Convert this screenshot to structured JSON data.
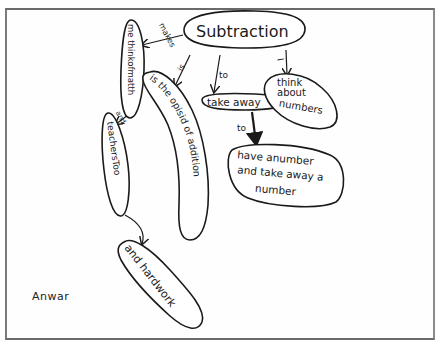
{
  "concept_map": {
    "author": "Anwar",
    "nodes": {
      "central": "Subtraction",
      "think_of_math": "me thinkofmatth",
      "teachers_too": "teachersToo",
      "opposite_addition": "is the opisid of addition",
      "take_away": "take away",
      "think_numbers": [
        "think",
        "about",
        "numbers"
      ],
      "have_number": [
        "have anumber",
        "and take away a",
        "number"
      ],
      "hardwork": "and hardwork"
    },
    "links": {
      "makes": "makes",
      "and": "and",
      "is": "is",
      "to_take_away": "to",
      "i": "I",
      "to_have_number": "to"
    }
  }
}
